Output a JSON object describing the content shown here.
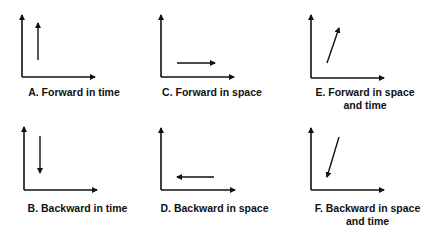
{
  "colors": {
    "ink": "#111111",
    "background": "#ffffff"
  },
  "panels": [
    {
      "id": "A",
      "label": "A. Forward in time",
      "label_lines": [
        "A. Forward in time"
      ],
      "arrow_direction": "up"
    },
    {
      "id": "B",
      "label": "B. Backward in time",
      "label_lines": [
        "B. Backward in time"
      ],
      "arrow_direction": "down"
    },
    {
      "id": "C",
      "label": "C. Forward in space",
      "label_lines": [
        "C. Forward in space"
      ],
      "arrow_direction": "right"
    },
    {
      "id": "D",
      "label": "D. Backward in space",
      "label_lines": [
        "D. Backward in space"
      ],
      "arrow_direction": "left"
    },
    {
      "id": "E",
      "label": "E. Forward in space and time",
      "label_lines": [
        "E. Forward in space",
        "and time"
      ],
      "arrow_direction": "up-right"
    },
    {
      "id": "F",
      "label": "F. Backward in space and time",
      "label_lines": [
        "F. Backward in space",
        "and time"
      ],
      "arrow_direction": "down-left"
    }
  ]
}
